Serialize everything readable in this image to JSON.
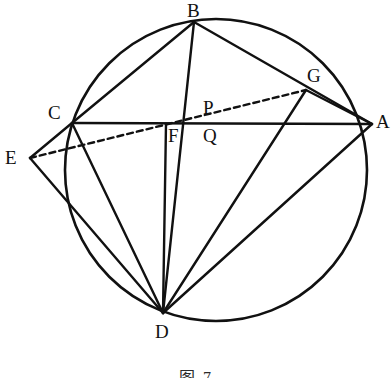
{
  "figure": {
    "caption": "图 7",
    "background_color": "#ffffff",
    "stroke_color": "#111111",
    "canvas": {
      "width": 392,
      "height": 378
    }
  },
  "circle": {
    "name": "circumcircle",
    "cx": 216,
    "cy": 170,
    "r": 151,
    "stroke_width": 2.6,
    "fill": "none"
  },
  "points": [
    {
      "id": "A",
      "label": "A",
      "x": 372,
      "y": 124,
      "label_x": 376,
      "label_y": 112,
      "on_circle": true
    },
    {
      "id": "B",
      "label": "B",
      "x": 194,
      "y": 22,
      "label_x": 187,
      "label_y": 1,
      "on_circle": true
    },
    {
      "id": "C",
      "label": "C",
      "x": 72,
      "y": 123,
      "label_x": 48,
      "label_y": 103,
      "on_circle": true
    },
    {
      "id": "D",
      "label": "D",
      "x": 163,
      "y": 313,
      "label_x": 155,
      "label_y": 322,
      "on_circle": true
    },
    {
      "id": "G",
      "label": "G",
      "x": 306,
      "y": 90,
      "label_x": 307,
      "label_y": 66,
      "on_circle": true
    },
    {
      "id": "E",
      "label": "E",
      "x": 30,
      "y": 158,
      "label_x": 5,
      "label_y": 148,
      "on_circle": false
    },
    {
      "id": "F",
      "label": "F",
      "x": 166,
      "y": 124,
      "label_x": 168,
      "label_y": 126,
      "on_circle": false
    },
    {
      "id": "P",
      "label": "P",
      "x": 205,
      "y": 113,
      "label_x": 203,
      "label_y": 98,
      "on_circle": false
    },
    {
      "id": "Q",
      "label": "Q",
      "x": 204,
      "y": 124,
      "label_x": 203,
      "label_y": 126,
      "on_circle": false
    }
  ],
  "segments": [
    {
      "name": "segment-B-C",
      "from": "B",
      "to": "C",
      "style": "solid"
    },
    {
      "name": "segment-B-A",
      "from": "B",
      "to": "A",
      "style": "solid"
    },
    {
      "name": "segment-B-D",
      "from": "B",
      "to": "D",
      "style": "solid"
    },
    {
      "name": "segment-C-A",
      "from": "C",
      "to": "A",
      "style": "solid"
    },
    {
      "name": "segment-C-D",
      "from": "C",
      "to": "D",
      "style": "solid"
    },
    {
      "name": "segment-A-D",
      "from": "A",
      "to": "D",
      "style": "solid"
    },
    {
      "name": "segment-G-D",
      "from": "G",
      "to": "D",
      "style": "solid"
    },
    {
      "name": "segment-G-A",
      "from": "G",
      "to": "A",
      "style": "solid"
    },
    {
      "name": "segment-F-D",
      "from": "F",
      "to": "D",
      "style": "solid"
    },
    {
      "name": "segment-E-C",
      "from": "E",
      "to": "C",
      "style": "solid"
    },
    {
      "name": "segment-E-D",
      "from": "E",
      "to": "D",
      "style": "solid"
    },
    {
      "name": "segment-E-G",
      "from": "E",
      "to": "G",
      "style": "dashed"
    }
  ],
  "styles": {
    "solid_width": 2.4,
    "dashed_width": 2.4,
    "dash_pattern": "6 4"
  }
}
